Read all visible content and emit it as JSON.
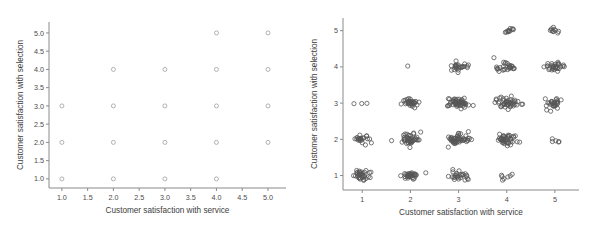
{
  "figure": {
    "panels": [
      "left",
      "right"
    ],
    "marker_shape": "open-circle",
    "marker_color": "#9a9a9a",
    "jitter_marker_color": "#555555",
    "background_color": "#ffffff",
    "axis_color": "#8a8a8a"
  },
  "chart_data": [
    {
      "type": "scatter",
      "title": "",
      "xlabel": "Customer satisfaction with service",
      "ylabel": "Customer satisfaction with selection",
      "xlim": [
        0.75,
        5.35
      ],
      "ylim": [
        0.75,
        5.3
      ],
      "xticks": [
        1.0,
        1.5,
        2.0,
        2.5,
        3.0,
        3.5,
        4.0,
        4.5,
        5.0
      ],
      "xticklabels": [
        "1.0",
        "1.5",
        "2.0",
        "2.5",
        "3.0",
        "3.5",
        "4.0",
        "4.5",
        "5.0"
      ],
      "yticks": [
        1.0,
        1.5,
        2.0,
        2.5,
        3.0,
        3.5,
        4.0,
        4.5,
        5.0
      ],
      "yticklabels": [
        "1.0",
        "1.5",
        "2.0",
        "2.5",
        "3.0",
        "3.5",
        "4.0",
        "4.5",
        "5.0"
      ],
      "grid": false,
      "legend": false,
      "points": [
        {
          "x": 1,
          "y": 1
        },
        {
          "x": 2,
          "y": 1
        },
        {
          "x": 3,
          "y": 1
        },
        {
          "x": 4,
          "y": 1
        },
        {
          "x": 1,
          "y": 2
        },
        {
          "x": 2,
          "y": 2
        },
        {
          "x": 3,
          "y": 2
        },
        {
          "x": 4,
          "y": 2
        },
        {
          "x": 5,
          "y": 2
        },
        {
          "x": 1,
          "y": 3
        },
        {
          "x": 2,
          "y": 3
        },
        {
          "x": 3,
          "y": 3
        },
        {
          "x": 4,
          "y": 3
        },
        {
          "x": 5,
          "y": 3
        },
        {
          "x": 2,
          "y": 4
        },
        {
          "x": 3,
          "y": 4
        },
        {
          "x": 4,
          "y": 4
        },
        {
          "x": 5,
          "y": 4
        },
        {
          "x": 4,
          "y": 5
        },
        {
          "x": 5,
          "y": 5
        }
      ]
    },
    {
      "type": "scatter",
      "title": "",
      "xlabel": "Customer satisfaction with service",
      "ylabel": "Customer satisfaction with selection",
      "xlim": [
        0.6,
        5.5
      ],
      "ylim": [
        0.6,
        5.35
      ],
      "xticks": [
        1,
        2,
        3,
        4,
        5
      ],
      "xticklabels": [
        "1",
        "2",
        "3",
        "4",
        "5"
      ],
      "yticks": [
        1,
        2,
        3,
        4,
        5
      ],
      "yticklabels": [
        "1",
        "2",
        "3",
        "4",
        "5"
      ],
      "grid": false,
      "legend": false,
      "jittered": true,
      "clusters": [
        {
          "x": 1,
          "y": 1,
          "n": 34,
          "sx": 0.1,
          "sy": 0.07
        },
        {
          "x": 2,
          "y": 1,
          "n": 30,
          "sx": 0.09,
          "sy": 0.06
        },
        {
          "x": 3,
          "y": 1,
          "n": 26,
          "sx": 0.09,
          "sy": 0.07
        },
        {
          "x": 4,
          "y": 1,
          "n": 7,
          "sx": 0.1,
          "sy": 0.09
        },
        {
          "x": 1,
          "y": 2,
          "n": 22,
          "sx": 0.08,
          "sy": 0.07
        },
        {
          "x": 2,
          "y": 2,
          "n": 46,
          "sx": 0.1,
          "sy": 0.09
        },
        {
          "x": 3,
          "y": 2,
          "n": 50,
          "sx": 0.11,
          "sy": 0.08
        },
        {
          "x": 4,
          "y": 2,
          "n": 42,
          "sx": 0.1,
          "sy": 0.08
        },
        {
          "x": 5,
          "y": 2,
          "n": 5,
          "sx": 0.08,
          "sy": 0.07
        },
        {
          "x": 1,
          "y": 3,
          "n": 3,
          "sx": 0.07,
          "sy": 0.05
        },
        {
          "x": 2,
          "y": 3,
          "n": 32,
          "sx": 0.1,
          "sy": 0.06
        },
        {
          "x": 3,
          "y": 3,
          "n": 52,
          "sx": 0.1,
          "sy": 0.07
        },
        {
          "x": 4,
          "y": 3,
          "n": 46,
          "sx": 0.11,
          "sy": 0.08
        },
        {
          "x": 5,
          "y": 3,
          "n": 28,
          "sx": 0.09,
          "sy": 0.08
        },
        {
          "x": 2,
          "y": 4,
          "n": 1,
          "sx": 0.03,
          "sy": 0.03
        },
        {
          "x": 3,
          "y": 4,
          "n": 26,
          "sx": 0.09,
          "sy": 0.06
        },
        {
          "x": 4,
          "y": 4,
          "n": 28,
          "sx": 0.09,
          "sy": 0.08
        },
        {
          "x": 5,
          "y": 4,
          "n": 32,
          "sx": 0.1,
          "sy": 0.06
        },
        {
          "x": 4,
          "y": 5,
          "n": 11,
          "sx": 0.08,
          "sy": 0.04
        },
        {
          "x": 5,
          "y": 5,
          "n": 10,
          "sx": 0.08,
          "sy": 0.05
        }
      ]
    }
  ]
}
